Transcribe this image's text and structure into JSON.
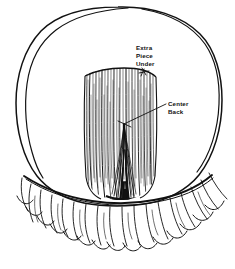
{
  "image": {
    "type": "line-art-illustration",
    "subject": "back-of-head-hairstyle-diagram",
    "background_color": "#ffffff",
    "ink_color": "#111111",
    "width": 235,
    "height": 269
  },
  "annotations": [
    {
      "id": "extra-piece-under",
      "lines": [
        "Extra",
        "Piece",
        "Under"
      ],
      "text_x": 136,
      "text_y": 50,
      "leader_to_x": 143,
      "leader_to_y": 73
    },
    {
      "id": "center-back",
      "lines": [
        "Center",
        "Back"
      ],
      "text_x": 166,
      "text_y": 105,
      "leader_to_x": 124,
      "leader_to_y": 124
    }
  ],
  "regions": {
    "head_outline": "large rounded oval occupying most of the frame",
    "hair_panel": "central rectangular panel of vertical hair strands",
    "center_back_wedge": "dark V-shaped wedge converging at center back",
    "fringe": "wispy strands hanging below the hem line"
  }
}
